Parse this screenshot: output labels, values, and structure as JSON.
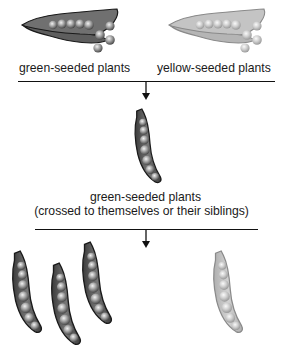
{
  "diagram": {
    "title": "",
    "parental_generation": {
      "left_label": "green-seeded plants",
      "right_label": "yellow-seeded plants"
    },
    "f1_generation": {
      "label_line1": "green-seeded plants",
      "label_line2": "(crossed to themselves or their siblings)"
    },
    "f2_generation": {
      "dark_pod_count": 3,
      "light_pod_count": 1
    },
    "colors": {
      "green_pod_fill": "#6e6e6e",
      "green_pod_stroke": "#1e1e1e",
      "yellow_pod_fill": "#bdbdbd",
      "yellow_pod_stroke": "#8c8c8c",
      "line": "#111111"
    }
  }
}
